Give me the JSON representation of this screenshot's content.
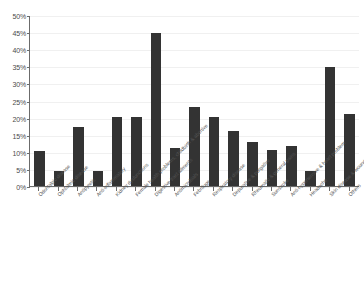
{
  "chart_data": {
    "type": "bar",
    "title": "",
    "subtitle": "",
    "xlabel": "",
    "ylabel": "",
    "ylim": [
      0,
      50
    ],
    "ytick_step": 5,
    "grid": true,
    "legend": false,
    "legend_position": "none",
    "value_unit": "%",
    "bar_color": "#333333",
    "axis_color": "#6b6b6b",
    "gridline_color": "#f0f0f0",
    "ytick_labels": [
      "50%",
      "45%",
      "40%",
      "35%",
      "30%",
      "25%",
      "20%",
      "15%",
      "10%",
      "5%",
      "0%"
    ],
    "ytick_values": [
      50,
      45,
      40,
      35,
      30,
      25,
      20,
      15,
      10,
      5,
      0
    ],
    "categories": [
      "Odontalgic disease",
      "Ophtalmic disease",
      "Antipyretic",
      "Anti-inflammatory",
      "Kidney dysfunctions",
      "Female health problems, childbirth & abortive",
      "Digestive tract ailments",
      "Antimicrobials",
      "Febrifuge",
      "Respiratory disease",
      "Depurative & purgative",
      "Rheumatic & general pains",
      "Sunstroke",
      "Anti-hypertensive & heart problem",
      "Headache",
      "Skin disease & wounds",
      "Others"
    ],
    "values": [
      10.2,
      4.3,
      17.2,
      4.3,
      20.2,
      20.2,
      44.8,
      11.0,
      23.0,
      20.3,
      16.0,
      13.0,
      10.5,
      11.8,
      4.3,
      34.8,
      21.0
    ]
  }
}
